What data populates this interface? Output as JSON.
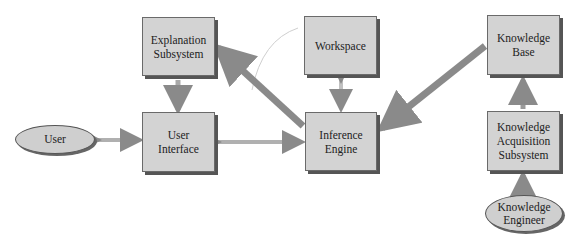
{
  "diagram": {
    "nodes": {
      "explanation": {
        "label": "Explanation\nSubsystem",
        "shape": "box"
      },
      "workspace": {
        "label": "Workspace",
        "shape": "box"
      },
      "knowledge_base": {
        "label": "Knowledge\nBase",
        "shape": "box"
      },
      "user": {
        "label": "User",
        "shape": "ellipse"
      },
      "user_interface": {
        "label": "User\nInterface",
        "shape": "box"
      },
      "inference_engine": {
        "label": "Inference\nEngine",
        "shape": "box"
      },
      "kas": {
        "label": "Knowledge\nAcquisition\nSubsystem",
        "shape": "box"
      },
      "knowledge_engineer": {
        "label": "Knowledge\nEngineer",
        "shape": "ellipse"
      }
    },
    "edges": [
      {
        "from": "user",
        "to": "user_interface",
        "type": "bidirectional"
      },
      {
        "from": "user_interface",
        "to": "inference_engine",
        "type": "bidirectional"
      },
      {
        "from": "explanation",
        "to": "user_interface",
        "type": "directed"
      },
      {
        "from": "inference_engine",
        "to": "explanation",
        "type": "directed"
      },
      {
        "from": "workspace",
        "to": "inference_engine",
        "type": "bidirectional"
      },
      {
        "from": "knowledge_base",
        "to": "inference_engine",
        "type": "directed"
      },
      {
        "from": "kas",
        "to": "knowledge_base",
        "type": "directed"
      },
      {
        "from": "knowledge_engineer",
        "to": "kas",
        "type": "directed"
      }
    ],
    "colors": {
      "box_fill": "#d3d3d3",
      "shadow": "#555555",
      "arrow": "#9a9a9a"
    }
  }
}
